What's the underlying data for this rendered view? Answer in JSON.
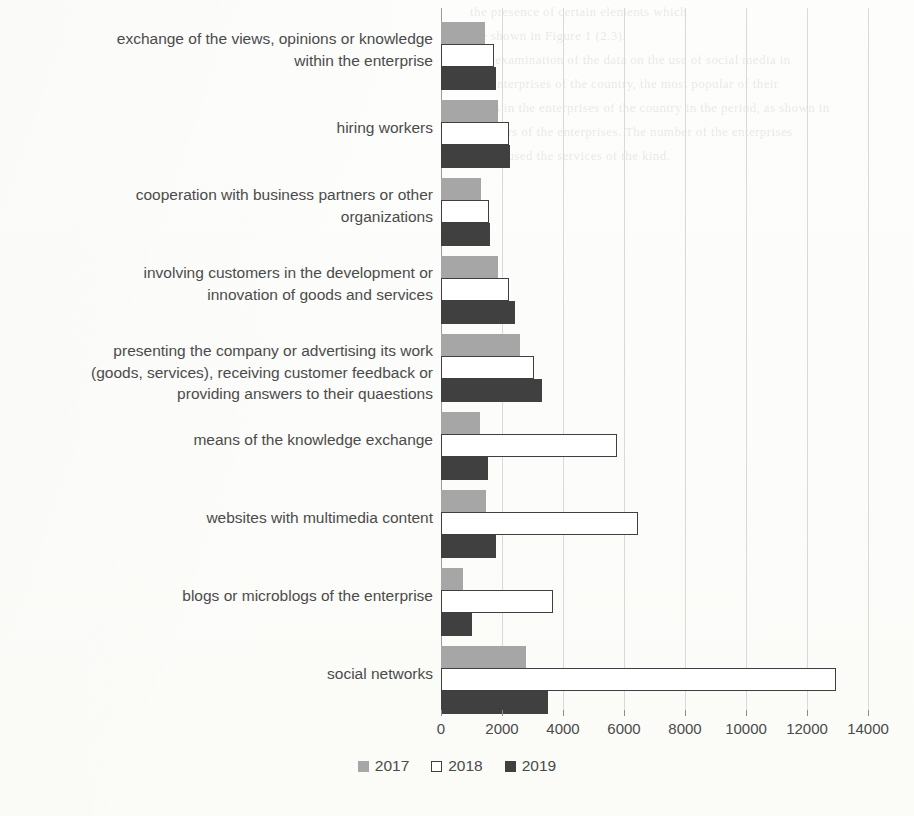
{
  "chart_data": {
    "type": "bar",
    "orientation": "horizontal",
    "title": "",
    "xlabel": "",
    "ylabel": "",
    "xlim": [
      0,
      14000
    ],
    "xticks": [
      "0",
      "2000",
      "4000",
      "6000",
      "8000",
      "10000",
      "12000",
      "14000"
    ],
    "xtick_values": [
      0,
      2000,
      4000,
      6000,
      8000,
      10000,
      12000,
      14000
    ],
    "grid": true,
    "legend_position": "bottom",
    "categories": [
      "exchange of the views, opinions or knowledge within the enterprise",
      "hiring workers",
      "cooperation with business partners or other organizations",
      "involving customers in the development or innovation of goods and services",
      "presenting the company or advertising its work (goods, services), receiving customer feedback or providing answers to their quaestions",
      "means of the knowledge exchange",
      "websites with multimedia content",
      "blogs or microblogs of the enterprise",
      "social networks"
    ],
    "category_lines": [
      [
        "exchange of the views, opinions or knowledge",
        "within the enterprise"
      ],
      [
        "hiring workers"
      ],
      [
        "cooperation with business partners or other",
        "organizations"
      ],
      [
        "involving customers in the development or",
        "innovation of goods and services"
      ],
      [
        "presenting the company or advertising its work",
        "(goods, services), receiving customer feedback or",
        "providing answers to their quaestions"
      ],
      [
        "means of the knowledge exchange"
      ],
      [
        "websites with multimedia content"
      ],
      [
        "blogs or microblogs of the enterprise"
      ],
      [
        "social networks"
      ]
    ],
    "series": [
      {
        "name": "2017",
        "color": "#a6a6a6",
        "values": [
          1440,
          1870,
          1320,
          1870,
          2600,
          1280,
          1470,
          730,
          2800
        ]
      },
      {
        "name": "2018",
        "color": "#ffffff",
        "edgecolor": "#3f3f3f",
        "values": [
          1740,
          2230,
          1560,
          2230,
          3060,
          5770,
          6460,
          3670,
          12950
        ]
      },
      {
        "name": "2019",
        "color": "#404040",
        "values": [
          1800,
          2260,
          1620,
          2430,
          3300,
          1540,
          1790,
          1010,
          3510
        ]
      }
    ]
  },
  "legend": {
    "items": [
      {
        "label": "2017",
        "style": "filled-gray"
      },
      {
        "label": "2018",
        "style": "outlined-white"
      },
      {
        "label": "2019",
        "style": "filled-dark"
      }
    ]
  },
  "colors": {
    "series_2017": "#a6a6a6",
    "series_2018": "#ffffff",
    "series_2018_edge": "#3f3f3f",
    "series_2019": "#404040",
    "gridline": "#d9d9d9",
    "axis": "#9a9a9a",
    "text": "#4a4a4a",
    "background": "#fdfdfb"
  }
}
